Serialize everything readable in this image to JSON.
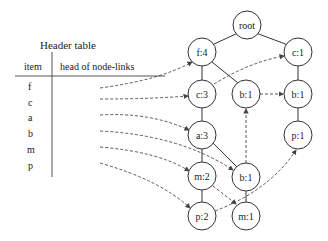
{
  "header_table": {
    "title": "Header table",
    "columns": [
      "item",
      "head of node-links"
    ],
    "items": [
      "f",
      "c",
      "a",
      "b",
      "m",
      "p"
    ]
  },
  "tree": {
    "nodes": [
      {
        "id": "root",
        "label": "root",
        "x": 247,
        "y": 25
      },
      {
        "id": "f4",
        "label": "f:4",
        "x": 202,
        "y": 52
      },
      {
        "id": "c1a",
        "label": "c:1",
        "x": 298,
        "y": 52
      },
      {
        "id": "c3",
        "label": "c:3",
        "x": 202,
        "y": 94
      },
      {
        "id": "b1a",
        "label": "b:1",
        "x": 246,
        "y": 94
      },
      {
        "id": "b1b",
        "label": "b:1",
        "x": 298,
        "y": 94
      },
      {
        "id": "a3",
        "label": "a:3",
        "x": 202,
        "y": 135
      },
      {
        "id": "p1",
        "label": "p:1",
        "x": 298,
        "y": 135
      },
      {
        "id": "m2",
        "label": "m:2",
        "x": 202,
        "y": 176
      },
      {
        "id": "b1c",
        "label": "b:1",
        "x": 246,
        "y": 177
      },
      {
        "id": "p2",
        "label": "p:2",
        "x": 202,
        "y": 216
      },
      {
        "id": "m1",
        "label": "m:1",
        "x": 246,
        "y": 216
      }
    ],
    "edges": [
      [
        "root",
        "f4"
      ],
      [
        "root",
        "c1a"
      ],
      [
        "f4",
        "c3"
      ],
      [
        "f4",
        "b1a"
      ],
      [
        "c1a",
        "b1b"
      ],
      [
        "c3",
        "a3"
      ],
      [
        "b1b",
        "p1"
      ],
      [
        "a3",
        "m2"
      ],
      [
        "a3",
        "b1c"
      ],
      [
        "m2",
        "p2"
      ],
      [
        "b1c",
        "m1"
      ]
    ],
    "node_links": [
      {
        "from": "header-f",
        "to": "f4"
      },
      {
        "from": "header-c",
        "to": "c3"
      },
      {
        "from": "c3",
        "to": "c1a"
      },
      {
        "from": "header-a",
        "to": "a3"
      },
      {
        "from": "header-b",
        "to": "b1c"
      },
      {
        "from": "b1c",
        "to": "b1a"
      },
      {
        "from": "b1a",
        "to": "b1b"
      },
      {
        "from": "header-m",
        "to": "m2"
      },
      {
        "from": "m2",
        "to": "m1"
      },
      {
        "from": "header-p",
        "to": "p2"
      },
      {
        "from": "p2",
        "to": "p1"
      }
    ]
  }
}
